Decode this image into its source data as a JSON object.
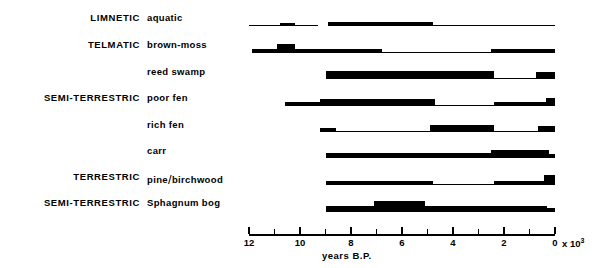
{
  "chart_data": {
    "type": "bar",
    "title": "",
    "xlabel": "years B.P.",
    "xlabel_exponent": "x 10",
    "xlabel_exponent_power": "3",
    "ylabel": "",
    "xlim": [
      12,
      0
    ],
    "x_ticks_major": [
      12,
      10,
      8,
      6,
      4,
      2,
      0
    ],
    "x_ticks_minor": [
      11,
      9,
      7,
      5,
      3,
      1
    ],
    "x_tick_labels": [
      "12",
      "10",
      "8",
      "6",
      "4",
      "2",
      "0"
    ],
    "grid": false,
    "legend": null,
    "axis_direction": "reversed (oldest at left)",
    "note": "Band thickness encodes relative abundance / importance of each hydroseral stage through time",
    "group_labels": [
      {
        "text": "LIMNETIC",
        "rows": [
          "aquatic"
        ]
      },
      {
        "text": "TELMATIC",
        "rows": [
          "brown-moss"
        ]
      },
      {
        "text": "SEMI-TERRESTRIC",
        "rows": [
          "reed swamp",
          "poor fen",
          "rich fen"
        ]
      },
      {
        "text": "TERRESTRIC",
        "rows": [
          "carr",
          "pine/birchwood"
        ]
      },
      {
        "text": "SEMI-TERRESTRIC",
        "rows": [
          "Sphagnum bog"
        ]
      }
    ],
    "categories": [
      "aquatic",
      "brown-moss",
      "reed swamp",
      "poor fen",
      "rich fen",
      "carr",
      "pine/birchwood",
      "Sphagnum bog"
    ],
    "series": [
      {
        "name": "aquatic",
        "group": "LIMNETIC",
        "segments": [
          {
            "from": 12.0,
            "to": 10.8,
            "thickness": 1
          },
          {
            "from": 10.8,
            "to": 10.2,
            "thickness": 3
          },
          {
            "from": 10.2,
            "to": 9.3,
            "thickness": 1
          },
          {
            "from": 9.3,
            "to": 8.9,
            "thickness": 0
          },
          {
            "from": 8.9,
            "to": 4.8,
            "thickness": 4
          },
          {
            "from": 4.8,
            "to": 0.0,
            "thickness": 1
          }
        ]
      },
      {
        "name": "brown-moss",
        "group": "TELMATIC",
        "segments": [
          {
            "from": 11.9,
            "to": 10.9,
            "thickness": 4
          },
          {
            "from": 10.9,
            "to": 10.2,
            "thickness": 9
          },
          {
            "from": 10.2,
            "to": 6.8,
            "thickness": 4
          },
          {
            "from": 6.8,
            "to": 2.5,
            "thickness": 1
          },
          {
            "from": 2.5,
            "to": 0.0,
            "thickness": 4
          }
        ]
      },
      {
        "name": "reed swamp",
        "group": "SEMI-TERRESTRIC",
        "segments": [
          {
            "from": 9.0,
            "to": 2.4,
            "thickness": 8
          },
          {
            "from": 2.4,
            "to": 0.75,
            "thickness": 1
          },
          {
            "from": 0.75,
            "to": 0.0,
            "thickness": 7
          }
        ]
      },
      {
        "name": "poor fen",
        "group": "SEMI-TERRESTRIC",
        "segments": [
          {
            "from": 10.6,
            "to": 9.2,
            "thickness": 4
          },
          {
            "from": 9.2,
            "to": 4.7,
            "thickness": 7
          },
          {
            "from": 4.7,
            "to": 2.4,
            "thickness": 1
          },
          {
            "from": 2.4,
            "to": 0.35,
            "thickness": 4
          },
          {
            "from": 0.35,
            "to": 0.0,
            "thickness": 8
          }
        ]
      },
      {
        "name": "rich fen",
        "group": "SEMI-TERRESTRIC",
        "segments": [
          {
            "from": 9.2,
            "to": 8.6,
            "thickness": 4
          },
          {
            "from": 8.6,
            "to": 4.9,
            "thickness": 1
          },
          {
            "from": 4.9,
            "to": 2.4,
            "thickness": 7
          },
          {
            "from": 2.4,
            "to": 0.65,
            "thickness": 1
          },
          {
            "from": 0.65,
            "to": 0.0,
            "thickness": 6
          }
        ]
      },
      {
        "name": "carr",
        "group": "TERRESTRIC",
        "segments": [
          {
            "from": 9.0,
            "to": 2.5,
            "thickness": 5
          },
          {
            "from": 2.5,
            "to": 0.25,
            "thickness": 8
          },
          {
            "from": 0.25,
            "to": 0.0,
            "thickness": 4
          }
        ]
      },
      {
        "name": "pine/birchwood",
        "group": "TERRESTRIC",
        "segments": [
          {
            "from": 9.0,
            "to": 4.8,
            "thickness": 4
          },
          {
            "from": 4.8,
            "to": 2.4,
            "thickness": 1
          },
          {
            "from": 2.4,
            "to": 0.45,
            "thickness": 4
          },
          {
            "from": 0.45,
            "to": 0.0,
            "thickness": 10
          }
        ]
      },
      {
        "name": "Sphagnum bog",
        "group": "SEMI-TERRESTRIC",
        "segments": [
          {
            "from": 9.0,
            "to": 7.1,
            "thickness": 6
          },
          {
            "from": 7.1,
            "to": 5.1,
            "thickness": 11
          },
          {
            "from": 5.1,
            "to": 0.3,
            "thickness": 6
          },
          {
            "from": 0.3,
            "to": 0.0,
            "thickness": 4
          }
        ]
      }
    ]
  }
}
